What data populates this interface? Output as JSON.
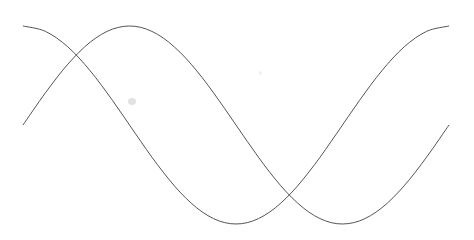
{
  "chart_data": {
    "type": "line",
    "title": "",
    "xlabel": "",
    "ylabel": "",
    "grid": false,
    "axes_visible": false,
    "legend": null,
    "xlim": [
      0,
      6.2832
    ],
    "ylim": [
      -1,
      1
    ],
    "x": [
      0,
      0.3307,
      0.6614,
      0.9921,
      1.3228,
      1.6535,
      1.9842,
      2.3149,
      2.6456,
      2.9762,
      3.3069,
      3.6376,
      3.9683,
      4.299,
      4.6297,
      4.9604,
      5.2911,
      5.6218,
      5.9525,
      6.2832
    ],
    "series": [
      {
        "name": "sin(x)",
        "color": "#555555",
        "values": [
          0,
          0.3247,
          0.6142,
          0.8372,
          0.9694,
          0.9966,
          0.9158,
          0.7357,
          0.4759,
          0.1646,
          -0.1646,
          -0.4759,
          -0.7357,
          -0.9158,
          -0.9966,
          -0.9694,
          -0.8372,
          -0.6142,
          -0.3247,
          0
        ]
      },
      {
        "name": "cos(x)",
        "color": "#555555",
        "values": [
          1,
          0.9458,
          0.7891,
          0.5469,
          0.2455,
          -0.0826,
          -0.4017,
          -0.6773,
          -0.8795,
          -0.9864,
          -0.9864,
          -0.8795,
          -0.6773,
          -0.4017,
          -0.0826,
          0.2455,
          0.5469,
          0.7891,
          0.9458,
          1
        ]
      }
    ],
    "plot_area_px": {
      "left": 23,
      "right": 449,
      "top": 26,
      "bottom": 224
    },
    "line_width": 1
  }
}
